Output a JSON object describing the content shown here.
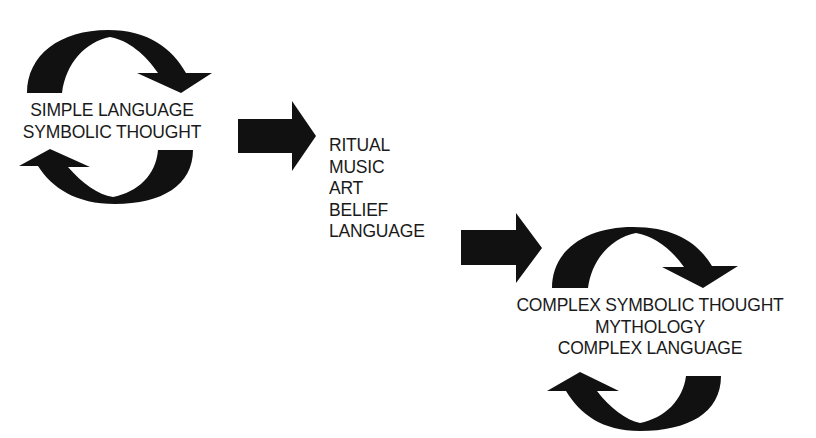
{
  "diagram": {
    "type": "flow",
    "stage1": {
      "lines": [
        "SIMPLE LANGUAGE",
        "SYMBOLIC THOUGHT"
      ],
      "cycle": "circular-arrows"
    },
    "transition": {
      "lines": [
        "RITUAL",
        "MUSIC",
        "ART",
        "BELIEF",
        "LANGUAGE"
      ]
    },
    "stage2": {
      "lines": [
        "COMPLEX SYMBOLIC THOUGHT",
        "MYTHOLOGY",
        "COMPLEX LANGUAGE"
      ],
      "cycle": "circular-arrows"
    },
    "colors": {
      "ink": "#111111",
      "text": "#1a1a1a",
      "background": "#ffffff"
    },
    "icons": {
      "cycle": "cycle-arrows-icon",
      "flow": "block-arrow-right-icon"
    }
  }
}
